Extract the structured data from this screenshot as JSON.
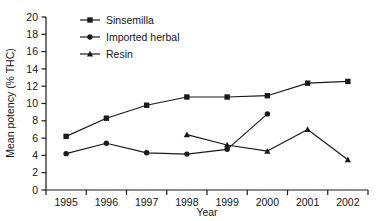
{
  "chart_data": {
    "type": "line",
    "title": "",
    "subtitle": "",
    "xlabel": "Year",
    "ylabel": "Mean potency (% THC)",
    "x": [
      1995,
      1996,
      1997,
      1998,
      1999,
      2000,
      2001,
      2002
    ],
    "xticklabels": [
      "1995",
      "1996",
      "1997",
      "1998",
      "1999",
      "2000",
      "2001",
      "2002"
    ],
    "yticklabels": [
      "0",
      "2",
      "4",
      "6",
      "8",
      "10",
      "12",
      "14",
      "16",
      "18",
      "20"
    ],
    "yticks": [
      0,
      2,
      4,
      6,
      8,
      10,
      12,
      14,
      16,
      18,
      20
    ],
    "xlim": [
      1994.5,
      2002.5
    ],
    "ylim": [
      0,
      20
    ],
    "grid": false,
    "legend_position": "upper left inside",
    "series": [
      {
        "name": "Sinsemilla",
        "marker": "square",
        "color": "#1a1a1a",
        "x": [
          1995,
          1996,
          1997,
          1998,
          1999,
          2000,
          2001,
          2002
        ],
        "values": [
          6.2,
          8.3,
          9.8,
          10.75,
          10.75,
          10.9,
          12.35,
          12.55
        ]
      },
      {
        "name": "Imported herbal",
        "marker": "circle",
        "color": "#1a1a1a",
        "x": [
          1995,
          1996,
          1997,
          1998,
          1999,
          2000
        ],
        "values": [
          4.2,
          5.4,
          4.3,
          4.15,
          4.7,
          8.8
        ]
      },
      {
        "name": "Resin",
        "marker": "triangle",
        "color": "#1a1a1a",
        "x": [
          1998,
          1999,
          2000,
          2001,
          2002
        ],
        "values": [
          6.4,
          5.2,
          4.5,
          7.0,
          3.5
        ]
      }
    ],
    "annotations": []
  },
  "axis": {
    "ylabel": "Mean potency (% THC)",
    "xlabel": "Year"
  },
  "legend": {
    "items": [
      {
        "label": "Sinsemilla",
        "marker": "square-marker-icon"
      },
      {
        "label": "Imported herbal",
        "marker": "circle-marker-icon"
      },
      {
        "label": "Resin",
        "marker": "triangle-marker-icon"
      }
    ]
  }
}
